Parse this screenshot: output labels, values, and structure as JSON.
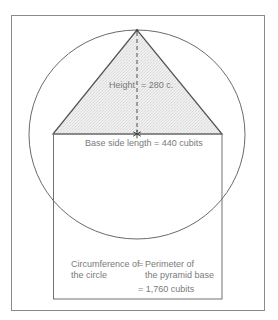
{
  "diagram": {
    "colors": {
      "stroke": "#6a6a6a",
      "frame": "#8a8a8a",
      "pyramid_fill": "#ececec",
      "text": "#7a7a7a",
      "background": "#ffffff"
    },
    "labels": {
      "height_word": "Height",
      "height_value": "= 280 c.",
      "base": "Base side length = 440 cubits",
      "circ_left_line1": "Circumference of",
      "circ_left_line2": "the circle",
      "circ_eq": "=",
      "perim_line1": "Perimeter of",
      "perim_line2": "the pyramid base",
      "total": "= 1,760 cubits"
    },
    "values": {
      "height_cubits": 280,
      "base_side_cubits": 440,
      "perimeter_cubits": 1760
    },
    "shapes": {
      "outer_frame": "rectangle",
      "circle": "circle centered on base midpoint, radius = pyramid height",
      "pyramid": "triangle cross-section",
      "inner_square": "square of pyramid base",
      "height_line": "dashed vertical",
      "center_marker": "asterisk"
    }
  }
}
